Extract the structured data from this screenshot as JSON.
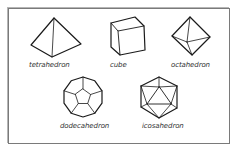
{
  "figure": {
    "title": "",
    "solids": [
      {
        "id": "tetrahedron",
        "label": "tetrahedron"
      },
      {
        "id": "cube",
        "label": "cube"
      },
      {
        "id": "octahedron",
        "label": "octahedron"
      },
      {
        "id": "dodecahedron",
        "label": "dodecahedron"
      },
      {
        "id": "icosahedron",
        "label": "icosahedron"
      }
    ],
    "colors": {
      "stroke": "#1a1a1a",
      "border": "#7a7a7a",
      "background": "#ffffff"
    }
  }
}
